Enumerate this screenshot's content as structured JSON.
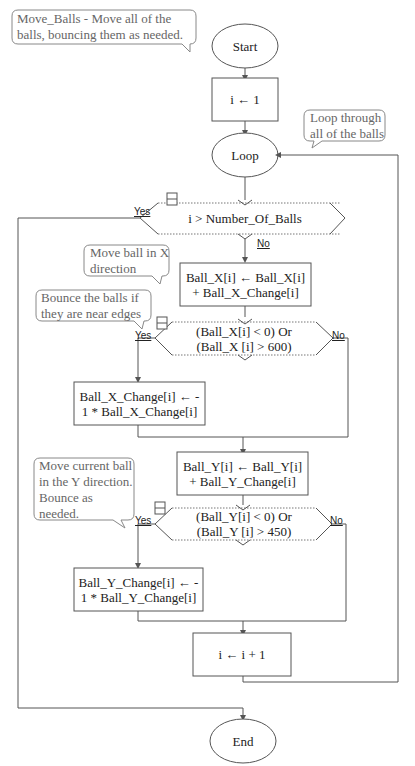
{
  "diagram": {
    "comments": {
      "header": "Move_Balls - Move all of the balls, bouncing them as needed.",
      "loop": "Loop through all of the balls",
      "move_x": "Move ball in X direction",
      "bounce_x": "Bounce the balls if they are near edges",
      "move_y": "Move current ball in the Y direction.  Bounce as needed."
    },
    "nodes": {
      "start": "Start",
      "init": "i ← 1",
      "loop": "Loop",
      "loop_cond": "i > Number_Of_Balls",
      "move_x": "Ball_X[i] ← Ball_X[i]  +  Ball_X_Change[i]",
      "cond_x": "(Ball_X[i] < 0) Or (Ball_X [i] > 600)",
      "bounce_x": "Ball_X_Change[i] ←  - 1  *  Ball_X_Change[i]",
      "move_y": "Ball_Y[i] ← Ball_Y[i]  +  Ball_Y_Change[i]",
      "cond_y": "(Ball_Y[i] < 0) Or (Ball_Y [i] > 450)",
      "bounce_y": "Ball_Y_Change[i] ←  - 1  *  Ball_Y_Change[i]",
      "increment": "i ← i  +  1",
      "end": "End"
    },
    "labels": {
      "yes": "Yes",
      "no": "No"
    }
  }
}
